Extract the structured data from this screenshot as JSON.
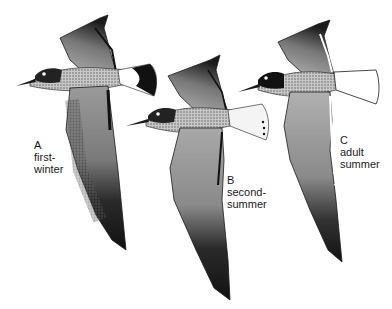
{
  "figure": {
    "birds": [
      {
        "letter": "A",
        "line1": "first-",
        "line2": "winter"
      },
      {
        "letter": "B",
        "line1": "second-",
        "line2": "summer"
      },
      {
        "letter": "C",
        "line1": "adult",
        "line2": "summer"
      }
    ],
    "colors": {
      "ink": "#1a1a1a",
      "mantle": "#9a9a9a",
      "light": "#d8d8d8",
      "paper": "#ffffff"
    }
  }
}
